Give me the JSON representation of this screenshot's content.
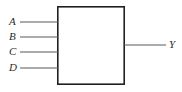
{
  "figure": {
    "kind": "black-box-logic-diagram",
    "background_color": "#ffffff",
    "stroke_color": "#231f20",
    "label_color": "#2b2b2b"
  },
  "block": {
    "name": "logic-block",
    "x": 57,
    "y": 6,
    "width": 68,
    "height": 79,
    "fill": "#ffffff",
    "border_width": 1.6,
    "caption": ""
  },
  "inputs": [
    {
      "label": "A",
      "y": 22,
      "line_x1": 20,
      "line_x2": 57,
      "label_x": 9,
      "label_y": 17
    },
    {
      "label": "B",
      "y": 37,
      "line_x1": 20,
      "line_x2": 57,
      "label_x": 9,
      "label_y": 32
    },
    {
      "label": "C",
      "y": 52,
      "line_x1": 20,
      "line_x2": 57,
      "label_x": 9,
      "label_y": 47
    },
    {
      "label": "D",
      "y": 68,
      "line_x1": 20,
      "line_x2": 57,
      "label_x": 9,
      "label_y": 63
    }
  ],
  "outputs": [
    {
      "label": "Y",
      "y": 45,
      "line_x1": 125,
      "line_x2": 166,
      "label_x": 169,
      "label_y": 40
    }
  ]
}
